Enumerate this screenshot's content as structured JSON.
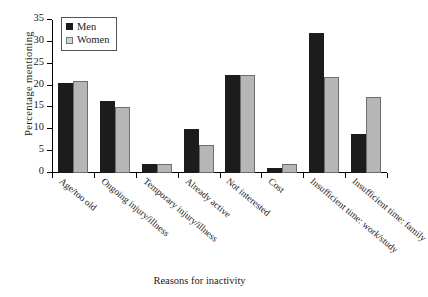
{
  "chart_data": {
    "type": "bar",
    "title": "",
    "xlabel": "Reasons for inactivity",
    "ylabel": "Percentage  mentioning",
    "ylim": [
      0,
      35
    ],
    "yticks": [
      0,
      5,
      10,
      15,
      20,
      25,
      30,
      35
    ],
    "grid": false,
    "legend_position": "top-left",
    "categories": [
      "Age/too old",
      "Ongoing injury/illness",
      "Temporary injury/illness",
      "Already active",
      "Not interested",
      "Cost",
      "Insufficient time: work/study",
      "Insufficient time: family"
    ],
    "series": [
      {
        "name": "Men",
        "color": "#1c1c1c",
        "values": [
          20.5,
          16.5,
          2.0,
          10.0,
          22.5,
          1.2,
          32.0,
          9.0
        ]
      },
      {
        "name": "Women",
        "color": "#b6b6b6",
        "values": [
          21.0,
          15.0,
          2.1,
          6.5,
          22.5,
          2.0,
          22.0,
          17.5
        ]
      }
    ]
  },
  "axis": {
    "y_title": "Percentage  mentioning",
    "x_title": "Reasons for inactivity",
    "y_tick_labels": [
      "0",
      "5",
      "10",
      "15",
      "20",
      "25",
      "30",
      "35"
    ]
  },
  "legend": {
    "items": [
      {
        "label": "Men"
      },
      {
        "label": "Women"
      }
    ]
  }
}
